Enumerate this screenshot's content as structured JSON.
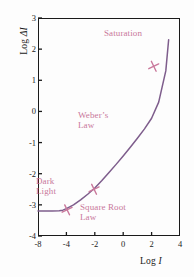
{
  "chart_data": {
    "type": "line",
    "title": "",
    "xlabel": "Log I",
    "ylabel": "Log ΔI",
    "xlabel_prefix": "Log ",
    "xlabel_symbol": "I",
    "ylabel_prefix": "Log ",
    "ylabel_symbol": "ΔI",
    "xlim": [
      -8,
      4
    ],
    "ylim": [
      -4,
      3
    ],
    "xticks": [
      -8,
      -4,
      -2,
      0,
      2,
      4
    ],
    "xtick_labels": [
      "-8",
      "-4",
      "-2",
      "0",
      "2",
      "4"
    ],
    "yticks": [
      3,
      2,
      1,
      0,
      -1,
      -2,
      -3,
      -4
    ],
    "ytick_labels": [
      "3",
      "2",
      "1",
      "0",
      "-1",
      "-2",
      "-3",
      "-4"
    ],
    "grid": false,
    "legend": "none",
    "series": [
      {
        "name": "Threshold versus intensity (TVI) function",
        "color": "#7e5d8c",
        "x": [
          -8.0,
          -6.0,
          -5.0,
          -4.5,
          -4.0,
          -3.5,
          -3.0,
          -2.5,
          -2.0,
          -1.5,
          -1.0,
          -0.5,
          0.0,
          0.5,
          1.0,
          1.5,
          2.0,
          2.5,
          3.0,
          3.2
        ],
        "y": [
          -3.2,
          -3.2,
          -3.19,
          -3.17,
          -3.12,
          -3.0,
          -2.84,
          -2.66,
          -2.46,
          -2.22,
          -1.96,
          -1.7,
          -1.43,
          -1.15,
          -0.86,
          -0.56,
          -0.22,
          0.3,
          1.3,
          2.3
        ]
      }
    ],
    "markers": [
      {
        "name": "dark-light-transition",
        "x": -3.95,
        "y": -3.16,
        "color": "#c9789b"
      },
      {
        "name": "square-root-weber-transition",
        "x": -2.05,
        "y": -2.5,
        "color": "#c9789b"
      },
      {
        "name": "weber-saturation-transition",
        "x": 2.15,
        "y": 1.45,
        "color": "#c9789b"
      }
    ],
    "annotations": [
      {
        "name": "saturation",
        "text": "Saturation",
        "x": 0.1,
        "y": 2.45,
        "color": "#c9789b"
      },
      {
        "name": "webers-law",
        "text": "Weber’s\nLaw",
        "x": -1.8,
        "y": 0.15,
        "color": "#c9789b"
      },
      {
        "name": "dark-light",
        "text": "Dark\nLight",
        "x": -5.4,
        "y": -2.25,
        "color": "#c9789b"
      },
      {
        "name": "square-root-law",
        "text": "Square Root\nLaw",
        "x": -1.5,
        "y": -3.0,
        "color": "#c9789b"
      }
    ],
    "colors": {
      "curve": "#7e5d8c",
      "annotation": "#c9789b",
      "marker": "#c9789b",
      "axis": "#1a1a1a",
      "background": "#fdfdfd"
    }
  }
}
